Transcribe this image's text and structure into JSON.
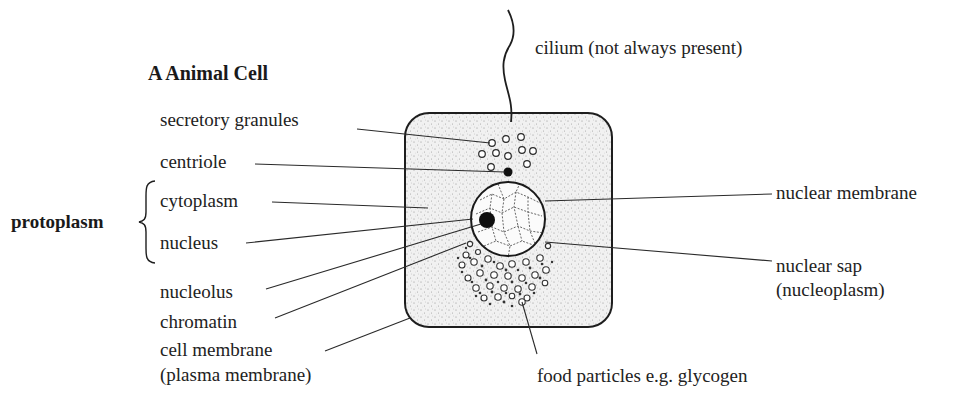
{
  "title": "A  Animal Cell",
  "group_label": "protoplasm",
  "labels": {
    "cilium": "cilium (not always present)",
    "secretory_granules": "secretory granules",
    "centriole": "centriole",
    "cytoplasm": "cytoplasm",
    "nucleus": "nucleus",
    "nucleolus": "nucleolus",
    "chromatin": "chromatin",
    "cell_membrane_line1": "cell membrane",
    "cell_membrane_line2": "(plasma membrane)",
    "nuclear_membrane": "nuclear membrane",
    "nuclear_sap_line1": "nuclear sap",
    "nuclear_sap_line2": "(nucleoplasm)",
    "food_particles": "food particles e.g. glycogen"
  },
  "colors": {
    "ink": "#1e1e1e",
    "cytoplasm_stipple": "#e9e9e9",
    "background": "#ffffff"
  }
}
